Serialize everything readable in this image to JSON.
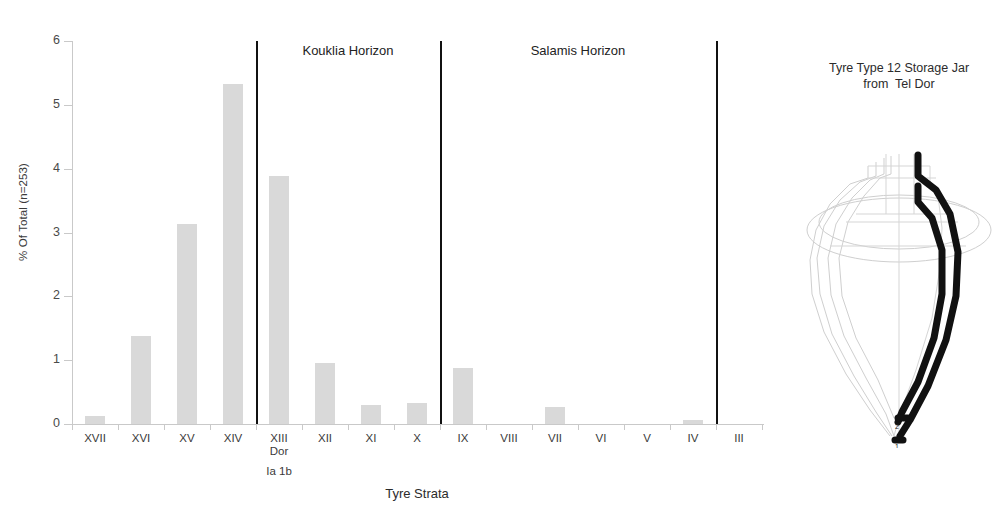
{
  "chart_data": {
    "type": "bar",
    "title": "",
    "xlabel": "Tyre Strata",
    "ylabel": "% Of Total (n=253)",
    "ylim": [
      0,
      6
    ],
    "yticks": [
      0,
      1,
      2,
      3,
      4,
      5,
      6
    ],
    "grid": false,
    "legend": "none",
    "bar_color": "#d9d9d9",
    "categories": [
      "XVII",
      "XVI",
      "XV",
      "XIV",
      "XIII",
      "XII",
      "XI",
      "X",
      "IX",
      "VIII",
      "VII",
      "VI",
      "V",
      "IV",
      "III"
    ],
    "category_sublabels": {
      "XIII": [
        "Dor",
        "Ia 1b"
      ]
    },
    "values": [
      0.12,
      1.38,
      3.14,
      5.33,
      3.88,
      0.95,
      0.3,
      0.33,
      0.87,
      0.0,
      0.26,
      0.0,
      0.0,
      0.06,
      0.0
    ],
    "annotations": [
      {
        "text": "Kouklia Horizon",
        "between": [
          "XIII",
          "X"
        ]
      },
      {
        "text": "Salamis Horizon",
        "between": [
          "IX",
          "IV"
        ]
      }
    ],
    "dividers": [
      {
        "after_category": "XIV"
      },
      {
        "after_category": "X"
      },
      {
        "after_category": "IV"
      }
    ]
  },
  "axis": {
    "ytick_labels": [
      "0",
      "1",
      "2",
      "3",
      "4",
      "5",
      "6"
    ],
    "y_title": "% Of Total (n=253)",
    "x_title": "Tyre Strata"
  },
  "horizons": [
    {
      "name": "kouklia",
      "label": "Kouklia Horizon"
    },
    {
      "name": "salamis",
      "label": "Salamis Horizon"
    }
  ],
  "categories": [
    {
      "label": "XVII",
      "sub": "",
      "sub2": ""
    },
    {
      "label": "XVI",
      "sub": "",
      "sub2": ""
    },
    {
      "label": "XV",
      "sub": "",
      "sub2": ""
    },
    {
      "label": "XIV",
      "sub": "",
      "sub2": ""
    },
    {
      "label": "XIII",
      "sub": "Dor",
      "sub2": "Ia 1b"
    },
    {
      "label": "XII",
      "sub": "",
      "sub2": ""
    },
    {
      "label": "XI",
      "sub": "",
      "sub2": ""
    },
    {
      "label": "X",
      "sub": "",
      "sub2": ""
    },
    {
      "label": "IX",
      "sub": "",
      "sub2": ""
    },
    {
      "label": "VIII",
      "sub": "",
      "sub2": ""
    },
    {
      "label": "VII",
      "sub": "",
      "sub2": ""
    },
    {
      "label": "VI",
      "sub": "",
      "sub2": ""
    },
    {
      "label": "V",
      "sub": "",
      "sub2": ""
    },
    {
      "label": "IV",
      "sub": "",
      "sub2": ""
    },
    {
      "label": "III",
      "sub": "",
      "sub2": ""
    }
  ],
  "illustration": {
    "title_line1": "Tyre Type 12 Storage Jar",
    "title_line2": "from  Tel Dor",
    "profile_labels": [
      "1",
      "2"
    ],
    "outline_color": "#111111",
    "ghost_color": "#cccccc"
  }
}
